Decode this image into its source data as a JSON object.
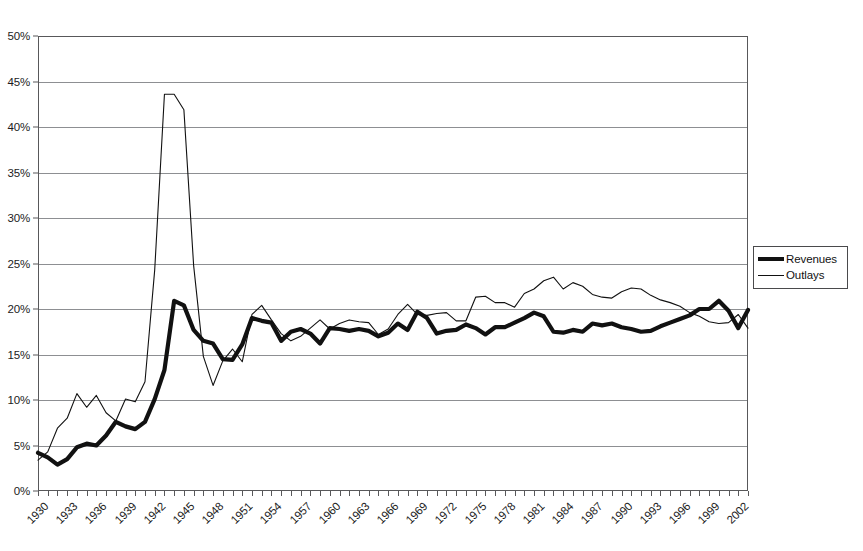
{
  "chart_data": {
    "type": "line",
    "title": "",
    "subtitle": "",
    "xlabel": "",
    "ylabel": "",
    "grid": true,
    "legend_position": "right",
    "xlim": [
      1930,
      2003
    ],
    "ylim": [
      0,
      50
    ],
    "y_ticks": [
      "0%",
      "5%",
      "10%",
      "15%",
      "20%",
      "25%",
      "30%",
      "35%",
      "40%",
      "45%",
      "50%"
    ],
    "y_tick_values": [
      0,
      5,
      10,
      15,
      20,
      25,
      30,
      35,
      40,
      45,
      50
    ],
    "x_tick_labels": [
      "1930",
      "1933",
      "1936",
      "1939",
      "1942",
      "1945",
      "1948",
      "1951",
      "1954",
      "1957",
      "1960",
      "1963",
      "1966",
      "1969",
      "1972",
      "1975",
      "1978",
      "1981",
      "1984",
      "1987",
      "1990",
      "1993",
      "1996",
      "1999",
      "2002"
    ],
    "x_tick_values": [
      1930,
      1933,
      1936,
      1939,
      1942,
      1945,
      1948,
      1951,
      1954,
      1957,
      1960,
      1963,
      1966,
      1969,
      1972,
      1975,
      1978,
      1981,
      1984,
      1987,
      1990,
      1993,
      1996,
      1999,
      2002
    ],
    "x": [
      1930,
      1931,
      1932,
      1933,
      1934,
      1935,
      1936,
      1937,
      1938,
      1939,
      1940,
      1941,
      1942,
      1943,
      1944,
      1945,
      1946,
      1947,
      1948,
      1949,
      1950,
      1951,
      1952,
      1953,
      1954,
      1955,
      1956,
      1957,
      1958,
      1959,
      1960,
      1961,
      1962,
      1963,
      1964,
      1965,
      1966,
      1967,
      1968,
      1969,
      1970,
      1971,
      1972,
      1973,
      1974,
      1975,
      1976,
      1977,
      1978,
      1979,
      1980,
      1981,
      1982,
      1983,
      1984,
      1985,
      1986,
      1987,
      1988,
      1989,
      1990,
      1991,
      1992,
      1993,
      1994,
      1995,
      1996,
      1997,
      1998,
      1999,
      2000,
      2001,
      2002,
      2003
    ],
    "series": [
      {
        "name": "Revenues",
        "line_style": "thick",
        "color": "#111111",
        "values": [
          4.2,
          3.7,
          2.9,
          3.5,
          4.8,
          5.2,
          5.0,
          6.1,
          7.6,
          7.1,
          6.8,
          7.6,
          10.1,
          13.3,
          20.9,
          20.4,
          17.7,
          16.5,
          16.2,
          14.5,
          14.4,
          16.1,
          19.0,
          18.7,
          18.5,
          16.5,
          17.5,
          17.8,
          17.3,
          16.2,
          17.9,
          17.8,
          17.6,
          17.8,
          17.6,
          17.0,
          17.4,
          18.4,
          17.7,
          19.7,
          19.0,
          17.3,
          17.6,
          17.7,
          18.3,
          17.9,
          17.2,
          18.0,
          18.0,
          18.5,
          19.0,
          19.6,
          19.2,
          17.5,
          17.4,
          17.7,
          17.5,
          18.4,
          18.2,
          18.4,
          18.0,
          17.8,
          17.5,
          17.6,
          18.1,
          18.5,
          18.9,
          19.3,
          20.0,
          20.0,
          20.9,
          19.8,
          17.9,
          19.9
        ]
      },
      {
        "name": "Outlays",
        "line_style": "thin",
        "color": "#111111",
        "values": [
          3.4,
          4.3,
          6.9,
          8.0,
          10.7,
          9.2,
          10.5,
          8.6,
          7.7,
          10.1,
          9.8,
          12.0,
          24.3,
          43.6,
          43.6,
          41.9,
          24.8,
          14.8,
          11.6,
          14.3,
          15.6,
          14.2,
          19.4,
          20.4,
          18.8,
          17.3,
          16.5,
          17.0,
          17.9,
          18.8,
          17.8,
          18.4,
          18.8,
          18.6,
          18.5,
          17.2,
          17.8,
          19.4,
          20.5,
          19.4,
          19.3,
          19.5,
          19.6,
          18.7,
          18.7,
          21.3,
          21.4,
          20.7,
          20.7,
          20.2,
          21.7,
          22.2,
          23.1,
          23.5,
          22.2,
          22.9,
          22.5,
          21.6,
          21.3,
          21.2,
          21.9,
          22.3,
          22.2,
          21.5,
          21.0,
          20.7,
          20.3,
          19.6,
          19.2,
          18.6,
          18.4,
          18.5,
          19.4,
          17.9
        ]
      }
    ]
  },
  "legend": {
    "entries": [
      {
        "label": "Revenues",
        "swatch": "thick-line-swatch"
      },
      {
        "label": "Outlays",
        "swatch": "thin-line-swatch"
      }
    ]
  }
}
